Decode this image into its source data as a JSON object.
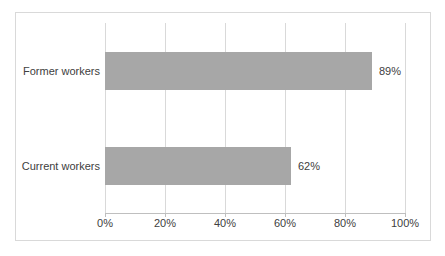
{
  "chart_data": {
    "type": "bar",
    "orientation": "horizontal",
    "title": "",
    "categories": [
      "Former workers",
      "Current workers"
    ],
    "values": [
      89,
      62
    ],
    "value_labels": [
      "89%",
      "62%"
    ],
    "x_ticks": [
      "0%",
      "20%",
      "40%",
      "60%",
      "80%",
      "100%"
    ],
    "xlim": [
      0,
      100
    ],
    "grid": true,
    "legend": false,
    "colors": {
      "bar": "#a7a7a7",
      "gridline": "#d9d9d9",
      "axis_line": "#bfbfbf",
      "frame_border": "#d9d9d9",
      "text": "#404040",
      "background": "#ffffff"
    }
  }
}
